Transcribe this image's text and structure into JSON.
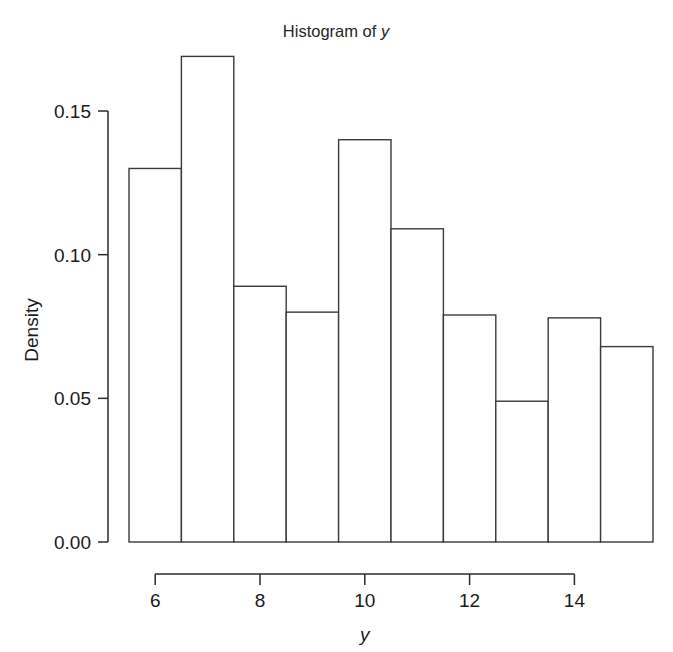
{
  "chart_data": {
    "type": "bar",
    "title": "Histogram of y",
    "title_variable": "y",
    "xlabel": "y",
    "ylabel": "Density",
    "grid": false,
    "legend": null,
    "xlim": [
      5.5,
      15.5
    ],
    "ylim": [
      0.0,
      0.17
    ],
    "x_axis_range_drawn": [
      6,
      14
    ],
    "y_axis_range_drawn": [
      0.0,
      0.15
    ],
    "xticks": [
      6,
      8,
      10,
      12,
      14
    ],
    "xtick_labels": [
      "6",
      "8",
      "10",
      "12",
      "14"
    ],
    "yticks": [
      0.0,
      0.05,
      0.1,
      0.15
    ],
    "ytick_labels": [
      "0.00",
      "0.05",
      "0.10",
      "0.15"
    ],
    "bin_width": 1,
    "bin_edges": [
      5.5,
      6.5,
      7.5,
      8.5,
      9.5,
      10.5,
      11.5,
      12.5,
      13.5,
      14.5,
      15.5
    ],
    "categories": [
      "5.5-6.5",
      "6.5-7.5",
      "7.5-8.5",
      "8.5-9.5",
      "9.5-10.5",
      "10.5-11.5",
      "11.5-12.5",
      "12.5-13.5",
      "13.5-14.5",
      "14.5-15.5"
    ],
    "values": [
      0.13,
      0.169,
      0.089,
      0.08,
      0.14,
      0.109,
      0.079,
      0.049,
      0.078,
      0.068
    ],
    "bar_fill": "#ffffff",
    "bar_stroke": "#3a3a3a",
    "axis_color": "#2b2b2b",
    "background": "#ffffff"
  },
  "figure": {
    "alt_name": "histogram-of-y"
  }
}
